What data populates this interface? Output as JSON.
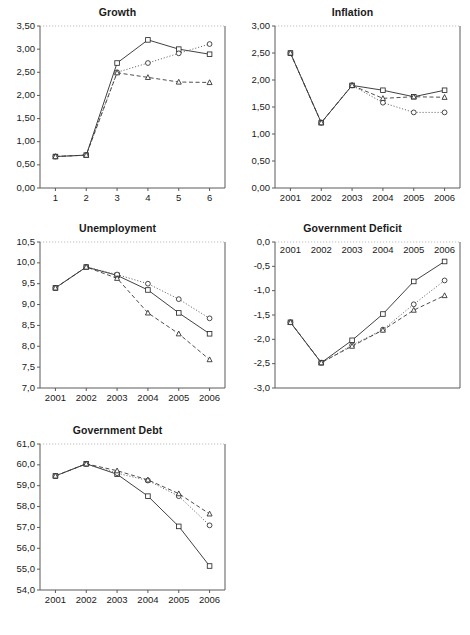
{
  "figure": {
    "caption": "",
    "decimal_separator": ",",
    "series_legend": [
      {
        "key": "square",
        "marker": "square",
        "line": "solid"
      },
      {
        "key": "circle",
        "marker": "circle",
        "line": "dotted"
      },
      {
        "key": "triangle",
        "marker": "triangle",
        "line": "dashed"
      }
    ]
  },
  "chart_data": [
    {
      "type": "line",
      "title": "Growth",
      "xlabel": "",
      "ylabel": "",
      "categories": [
        "1",
        "2",
        "3",
        "4",
        "5",
        "6"
      ],
      "xtick_labels": [
        "1",
        "2",
        "3",
        "4",
        "5",
        "6"
      ],
      "ytick_labels": [
        "0,00",
        "0,50",
        "1,00",
        "1,50",
        "2,00",
        "2,50",
        "3,00",
        "3,50"
      ],
      "ylim": [
        0.0,
        3.5
      ],
      "ytick_values": [
        0.0,
        0.5,
        1.0,
        1.5,
        2.0,
        2.5,
        3.0,
        3.5
      ],
      "grid": false,
      "legend": "none",
      "series": [
        {
          "name": "square",
          "marker": "square",
          "line": "solid",
          "values": [
            0.68,
            0.71,
            2.7,
            3.2,
            3.0,
            2.89
          ]
        },
        {
          "name": "circle",
          "marker": "circle",
          "line": "dotted",
          "values": [
            0.68,
            0.71,
            2.5,
            2.7,
            2.91,
            3.11
          ]
        },
        {
          "name": "triangle",
          "marker": "triangle",
          "line": "dashed",
          "values": [
            0.68,
            0.71,
            2.49,
            2.39,
            2.29,
            2.28
          ]
        }
      ]
    },
    {
      "type": "line",
      "title": "Inflation",
      "xlabel": "",
      "ylabel": "",
      "categories": [
        "2001",
        "2002",
        "2003",
        "2004",
        "2005",
        "2006"
      ],
      "xtick_labels": [
        "2001",
        "2002",
        "2003",
        "2004",
        "2005",
        "2006"
      ],
      "ytick_labels": [
        "0,00",
        "0,50",
        "1,00",
        "1,50",
        "2,00",
        "2,50",
        "3,00"
      ],
      "ylim": [
        0.0,
        3.0
      ],
      "ytick_values": [
        0.0,
        0.5,
        1.0,
        1.5,
        2.0,
        2.5,
        3.0
      ],
      "grid": false,
      "legend": "none",
      "series": [
        {
          "name": "square",
          "marker": "square",
          "line": "solid",
          "values": [
            2.5,
            1.21,
            1.9,
            1.81,
            1.69,
            1.81
          ]
        },
        {
          "name": "circle",
          "marker": "circle",
          "line": "dotted",
          "values": [
            2.5,
            1.21,
            1.9,
            1.58,
            1.4,
            1.4
          ]
        },
        {
          "name": "triangle",
          "marker": "triangle",
          "line": "dashed",
          "values": [
            2.5,
            1.21,
            1.9,
            1.66,
            1.69,
            1.68
          ]
        }
      ]
    },
    {
      "type": "line",
      "title": "Unemployment",
      "xlabel": "",
      "ylabel": "",
      "categories": [
        "2001",
        "2002",
        "2003",
        "2004",
        "2005",
        "2006"
      ],
      "xtick_labels": [
        "2001",
        "2002",
        "2003",
        "2004",
        "2005",
        "2006"
      ],
      "ytick_labels": [
        "7,0",
        "7,5",
        "8,0",
        "8,5",
        "9,0",
        "9,5",
        "10,0",
        "10,5"
      ],
      "ylim": [
        7.0,
        10.5
      ],
      "ytick_values": [
        7.0,
        7.5,
        8.0,
        8.5,
        9.0,
        9.5,
        10.0,
        10.5
      ],
      "grid": false,
      "legend": "none",
      "series": [
        {
          "name": "square",
          "marker": "square",
          "line": "solid",
          "values": [
            9.4,
            9.9,
            9.7,
            9.35,
            8.8,
            8.3
          ]
        },
        {
          "name": "circle",
          "marker": "circle",
          "line": "dotted",
          "values": [
            9.4,
            9.9,
            9.72,
            9.5,
            9.13,
            8.67
          ]
        },
        {
          "name": "triangle",
          "marker": "triangle",
          "line": "dashed",
          "values": [
            9.4,
            9.9,
            9.63,
            8.8,
            8.3,
            7.68
          ]
        }
      ]
    },
    {
      "type": "line",
      "title": "Government Deficit",
      "xlabel": "",
      "ylabel": "",
      "categories": [
        "2001",
        "2002",
        "2003",
        "2004",
        "2005",
        "2006"
      ],
      "xtick_labels": [
        "2001",
        "2002",
        "2003",
        "2004",
        "2005",
        "2006"
      ],
      "xtick_position": "top",
      "ytick_labels": [
        "-3,0",
        "-2,5",
        "-2,0",
        "-1,5",
        "-1,0",
        "-0,5",
        "0,0"
      ],
      "ylim": [
        -3.0,
        0.0
      ],
      "ytick_values": [
        -3.0,
        -2.5,
        -2.0,
        -1.5,
        -1.0,
        -0.5,
        0.0
      ],
      "grid": false,
      "legend": "none",
      "series": [
        {
          "name": "square",
          "marker": "square",
          "line": "solid",
          "values": [
            -1.65,
            -2.48,
            -2.02,
            -1.48,
            -0.81,
            -0.4
          ]
        },
        {
          "name": "circle",
          "marker": "circle",
          "line": "dotted",
          "values": [
            -1.65,
            -2.48,
            -2.12,
            -1.8,
            -1.28,
            -0.79
          ]
        },
        {
          "name": "triangle",
          "marker": "triangle",
          "line": "dashed",
          "values": [
            -1.65,
            -2.48,
            -2.14,
            -1.81,
            -1.4,
            -1.1
          ]
        }
      ]
    },
    {
      "type": "line",
      "title": "Government Debt",
      "xlabel": "",
      "ylabel": "",
      "categories": [
        "2001",
        "2002",
        "2003",
        "2004",
        "2005",
        "2006"
      ],
      "xtick_labels": [
        "2001",
        "2002",
        "2003",
        "2004",
        "2005",
        "2006"
      ],
      "ytick_labels": [
        "54,0",
        "55,0",
        "56,0",
        "57,0",
        "58,0",
        "59,0",
        "60,0",
        "61,0"
      ],
      "ylim": [
        54.0,
        61.0
      ],
      "ytick_values": [
        54.0,
        55.0,
        56.0,
        57.0,
        58.0,
        59.0,
        60.0,
        61.0
      ],
      "grid": false,
      "legend": "none",
      "series": [
        {
          "name": "square",
          "marker": "square",
          "line": "solid",
          "values": [
            59.47,
            60.05,
            59.55,
            58.5,
            57.05,
            55.15
          ]
        },
        {
          "name": "circle",
          "marker": "circle",
          "line": "dotted",
          "values": [
            59.47,
            60.05,
            59.6,
            59.25,
            58.5,
            57.1
          ]
        },
        {
          "name": "triangle",
          "marker": "triangle",
          "line": "dashed",
          "values": [
            59.47,
            60.05,
            59.72,
            59.28,
            58.62,
            57.65
          ]
        }
      ]
    }
  ]
}
